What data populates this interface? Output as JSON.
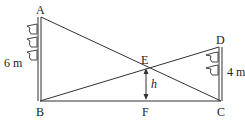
{
  "diagram": {
    "points": {
      "A": {
        "label": "A",
        "x": 40,
        "y": 17
      },
      "B": {
        "label": "B",
        "x": 40,
        "y": 101
      },
      "C": {
        "label": "C",
        "x": 221,
        "y": 101
      },
      "D": {
        "label": "D",
        "x": 221,
        "y": 47
      },
      "E": {
        "label": "E",
        "x": 146,
        "y": 67
      },
      "F": {
        "label": "F",
        "x": 146,
        "y": 101
      }
    },
    "measures": {
      "left_pole_height": "6 m",
      "right_pole_height": "4 m",
      "height_label": "h"
    },
    "segments": [
      "AB",
      "DC",
      "BC",
      "AC",
      "BD",
      "EF"
    ],
    "colors": {
      "line": "#333333",
      "text": "#222222",
      "background": "#ffffff"
    }
  }
}
